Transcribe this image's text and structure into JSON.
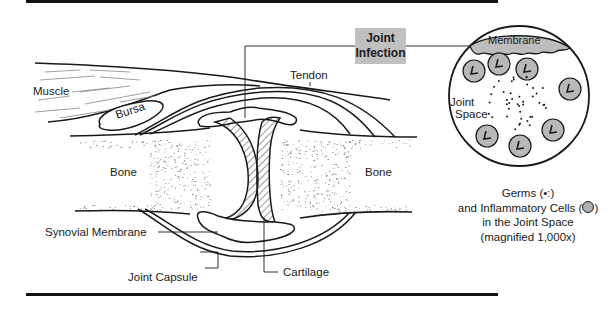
{
  "diagram": {
    "callout": {
      "line1": "Joint",
      "line2": "Infection"
    },
    "labels": {
      "muscle": "Muscle",
      "bursa": "Bursa",
      "tendon": "Tendon",
      "bone_left": "Bone",
      "bone_right": "Bone",
      "synovial_membrane": "Synovial Membrane",
      "joint_capsule": "Joint Capsule",
      "cartilage": "Cartilage"
    },
    "magnified_view": {
      "membrane": "Membrane",
      "joint_space_line1": "Joint",
      "joint_space_line2": "Space",
      "caption": {
        "line1": "Germs (•:)",
        "line2": "and Inflammatory Cells (",
        "line2_end": ")",
        "line3": "in the Joint Space",
        "line4": "(magnified 1,000x)"
      }
    },
    "colors": {
      "ink": "#1a1a1a",
      "fill_gray": "#c0c0c0",
      "cell_fill": "#b8b8b8"
    }
  }
}
